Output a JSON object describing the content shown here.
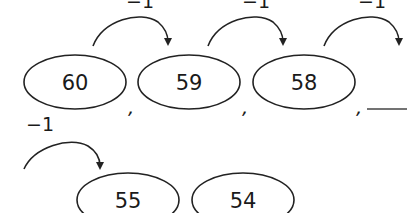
{
  "worksheet": {
    "step_label": "−1",
    "row1": {
      "numbers": [
        "60",
        "59",
        "58"
      ],
      "blank": "",
      "separator": ","
    },
    "row2": {
      "numbers": [
        "55",
        "54"
      ]
    },
    "step_labels": [
      "−1",
      "−1",
      "−1",
      "−1"
    ],
    "colors": {
      "ink": "#1a1a1a",
      "background": "#ffffff"
    }
  }
}
